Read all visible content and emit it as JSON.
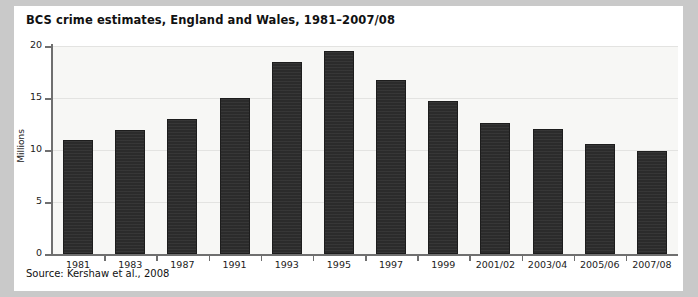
{
  "figure": {
    "title": "BCS crime estimates, England and Wales, 1981–2007/08",
    "source": "Source: Kershaw et al., 2008"
  },
  "chart_data": {
    "type": "bar",
    "title": "BCS crime estimates, England and Wales, 1981–2007/08",
    "xlabel": "",
    "ylabel": "Millions",
    "ylim": [
      0,
      20
    ],
    "yticks": [
      0,
      5,
      10,
      15,
      20
    ],
    "grid": true,
    "legend": "none",
    "bar_color": "#2b2b2b",
    "plot_background": "#f7f7f5",
    "categories": [
      "1981",
      "1983",
      "1987",
      "1991",
      "1993",
      "1995",
      "1997",
      "1999",
      "2001/02",
      "2003/04",
      "2005/06",
      "2007/08"
    ],
    "values": [
      11.0,
      11.9,
      13.0,
      15.0,
      18.5,
      19.5,
      16.7,
      14.7,
      12.6,
      12.0,
      10.6,
      9.9
    ],
    "annotations": []
  }
}
